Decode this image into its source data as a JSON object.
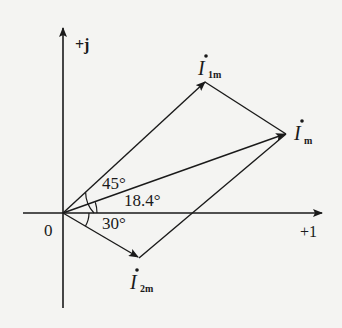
{
  "diagram": {
    "type": "phasor-diagram",
    "axes": {
      "imaginary_label": "+j",
      "real_label": "+1",
      "origin_label": "0"
    },
    "phasors": [
      {
        "id": "I1m",
        "symbol": "I",
        "subscript": "1m",
        "angle_deg": 45
      },
      {
        "id": "Im",
        "symbol": "I",
        "subscript": "m",
        "angle_deg": 18.4
      },
      {
        "id": "I2m",
        "symbol": "I",
        "subscript": "2m",
        "angle_deg": -30
      }
    ],
    "angle_labels": {
      "a45": "45°",
      "a18": "18.4°",
      "a30": "30°"
    },
    "colors": {
      "ink": "#1a1a1a",
      "paper": "#f4f4f2"
    }
  }
}
